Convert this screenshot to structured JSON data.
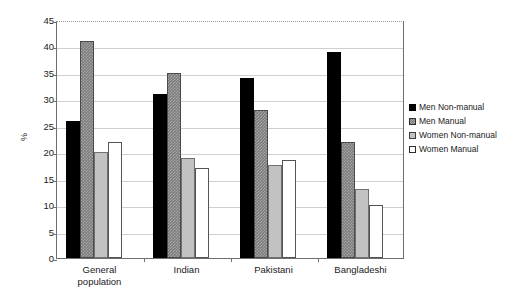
{
  "chart_data": {
    "type": "bar",
    "title": "",
    "xlabel": "",
    "ylabel": "%",
    "ylim": [
      0,
      45
    ],
    "ytick_step": 5,
    "yticks": [
      45,
      40,
      35,
      30,
      25,
      20,
      15,
      10,
      5,
      0
    ],
    "grid": true,
    "legend_position": "right",
    "categories": [
      "General population",
      "Indian",
      "Pakistani",
      "Bangladeshi"
    ],
    "category_lines": [
      [
        "General",
        "population"
      ],
      [
        "Indian"
      ],
      [
        "Pakistani"
      ],
      [
        "Bangladeshi"
      ]
    ],
    "series": [
      {
        "name": "Men Non-manual",
        "color": "#000000",
        "values": [
          26,
          31,
          34,
          39
        ]
      },
      {
        "name": "Men Manual",
        "color": "#7d7d7d",
        "values": [
          41,
          35,
          28,
          22
        ]
      },
      {
        "name": "Women Non-manual",
        "color": "#c2c2c2",
        "values": [
          20,
          19,
          17.5,
          13
        ]
      },
      {
        "name": "Women Manual",
        "color": "#ffffff",
        "values": [
          22,
          17,
          18.5,
          10
        ]
      }
    ]
  }
}
